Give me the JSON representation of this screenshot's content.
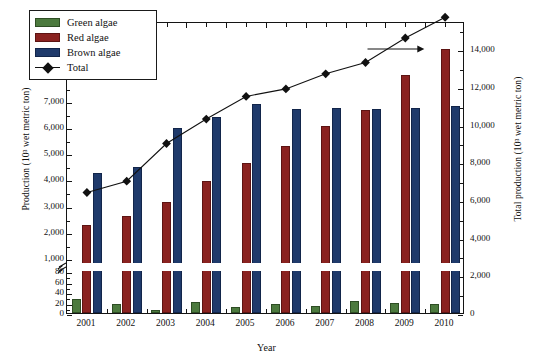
{
  "chart_data": {
    "type": "bar",
    "title": "",
    "xlabel": "Year",
    "ylabel": "Production (10³ wet metric ton)",
    "ylabel_right": "Total production (10³ wet metric ton)",
    "categories": [
      "2001",
      "2002",
      "2003",
      "2004",
      "2005",
      "2006",
      "2007",
      "2008",
      "2009",
      "2010"
    ],
    "series": [
      {
        "name": "Green algae",
        "color": "#4c7a3e",
        "axis": "left",
        "values": [
          27,
          18,
          5,
          21,
          11,
          17,
          14,
          23,
          20,
          17
        ]
      },
      {
        "name": "Red algae",
        "color": "#8a2220",
        "axis": "left",
        "values": [
          2250,
          2620,
          3130,
          3930,
          4640,
          5260,
          6020,
          6660,
          7990,
          8990
        ]
      },
      {
        "name": "Brown algae",
        "color": "#1f3a6b",
        "axis": "left",
        "values": [
          4240,
          4480,
          5970,
          6390,
          6880,
          6670,
          6740,
          6700,
          6710,
          6780
        ]
      },
      {
        "name": "Total",
        "color": "#111111",
        "axis": "right",
        "marker": "diamond",
        "values": [
          6500,
          7100,
          9100,
          10400,
          11600,
          12000,
          12800,
          13400,
          14700,
          15800
        ]
      }
    ],
    "ylim_left": [
      0,
      10000
    ],
    "ylim_left_break": {
      "lower": [
        0,
        80
      ],
      "upper": [
        1000,
        10000
      ],
      "note": "broken y-axis between 80 and 1,000"
    },
    "yticks_left_lower": [
      "0",
      "20",
      "40",
      "60",
      "80"
    ],
    "yticks_left_upper": [
      "1,000",
      "2,000",
      "3,000",
      "4,000",
      "5,000",
      "6,000",
      "7,000",
      "8,000",
      "9,000",
      "10,000"
    ],
    "ylim_right": [
      0,
      16000
    ],
    "yticks_right": [
      "0",
      "2,000",
      "4,000",
      "6,000",
      "8,000",
      "10,000",
      "12,000",
      "14,000",
      "16,000"
    ],
    "grid": false,
    "legend_position": "top-left",
    "legend_entries": [
      "Green algae",
      "Red algae",
      "Brown algae",
      "Total"
    ],
    "annotations": [
      {
        "type": "arrow",
        "label": "",
        "direction": "right",
        "near_category": "2009",
        "meaning": "Total series uses right-hand axis"
      }
    ]
  },
  "legend": {
    "items": [
      {
        "label": "Green algae"
      },
      {
        "label": "Red algae"
      },
      {
        "label": "Brown algae"
      },
      {
        "label": "Total"
      }
    ]
  },
  "axes": {
    "left_title": "Production (10³ wet metric ton)",
    "right_title": "Total production (10³ wet metric ton)",
    "x_title": "Year"
  }
}
